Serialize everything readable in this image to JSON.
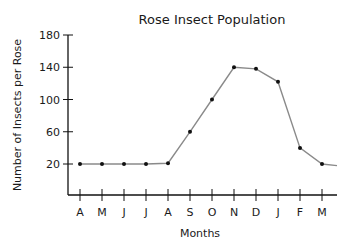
{
  "chart_data": {
    "type": "line",
    "title": "Rose Insect Population",
    "xlabel": "Months",
    "ylabel": "Number of Insects per Rose",
    "categories": [
      "A",
      "M",
      "J",
      "J",
      "A",
      "S",
      "O",
      "N",
      "D",
      "J",
      "F",
      "M"
    ],
    "series": [
      {
        "name": "Insects per Rose",
        "values": [
          20,
          20,
          20,
          20,
          21,
          60,
          100,
          140,
          138,
          122,
          40,
          20
        ]
      }
    ],
    "trailing_value": 18,
    "y_ticks": [
      20,
      60,
      100,
      140,
      180
    ],
    "ylim": [
      0,
      180
    ],
    "grid": false,
    "legend": "none",
    "colors": {
      "line": "#8a8a8a",
      "marker": "#111111",
      "axis": "#111111"
    }
  }
}
